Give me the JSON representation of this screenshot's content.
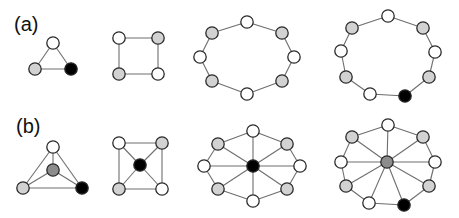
{
  "labels": {
    "a": "(a)",
    "b": "(b)"
  },
  "colors": {
    "white": "#ffffff",
    "gray": "#d2d2d2",
    "dark_gray": "#8c8c8c",
    "black": "#000000",
    "edge": "#6e6e6e",
    "outline": "#2a2a2a"
  },
  "node_radius": 6.2,
  "graphs": [
    {
      "id": "a-triangle",
      "row": "a",
      "nodes": [
        {
          "x": 53,
          "y": 43,
          "c": "white"
        },
        {
          "x": 35,
          "y": 69,
          "c": "gray"
        },
        {
          "x": 71,
          "y": 69,
          "c": "black"
        }
      ],
      "edges": [
        [
          0,
          1
        ],
        [
          1,
          2
        ],
        [
          2,
          0
        ]
      ]
    },
    {
      "id": "a-square",
      "row": "a",
      "nodes": [
        {
          "x": 119,
          "y": 38,
          "c": "white"
        },
        {
          "x": 158,
          "y": 38,
          "c": "gray"
        },
        {
          "x": 158,
          "y": 74,
          "c": "white"
        },
        {
          "x": 119,
          "y": 74,
          "c": "gray"
        }
      ],
      "edges": [
        [
          0,
          1
        ],
        [
          1,
          2
        ],
        [
          2,
          3
        ],
        [
          3,
          0
        ]
      ]
    },
    {
      "id": "a-octagon",
      "row": "a",
      "nodes": [
        {
          "x": 247,
          "y": 22,
          "c": "white"
        },
        {
          "x": 282,
          "y": 33,
          "c": "gray"
        },
        {
          "x": 294,
          "y": 57,
          "c": "white"
        },
        {
          "x": 282,
          "y": 81,
          "c": "gray"
        },
        {
          "x": 247,
          "y": 94,
          "c": "white"
        },
        {
          "x": 212,
          "y": 81,
          "c": "gray"
        },
        {
          "x": 200,
          "y": 57,
          "c": "white"
        },
        {
          "x": 212,
          "y": 33,
          "c": "gray"
        }
      ],
      "edges": [
        [
          0,
          1
        ],
        [
          1,
          2
        ],
        [
          2,
          3
        ],
        [
          3,
          4
        ],
        [
          4,
          5
        ],
        [
          5,
          6
        ],
        [
          6,
          7
        ],
        [
          7,
          0
        ]
      ]
    },
    {
      "id": "a-nonagon",
      "row": "a",
      "nodes": [
        {
          "x": 388,
          "y": 16,
          "c": "white"
        },
        {
          "x": 423,
          "y": 28,
          "c": "gray"
        },
        {
          "x": 435,
          "y": 52,
          "c": "white"
        },
        {
          "x": 429,
          "y": 77,
          "c": "gray"
        },
        {
          "x": 405,
          "y": 96,
          "c": "black"
        },
        {
          "x": 370,
          "y": 94,
          "c": "white"
        },
        {
          "x": 346,
          "y": 77,
          "c": "gray"
        },
        {
          "x": 341,
          "y": 51,
          "c": "white"
        },
        {
          "x": 352,
          "y": 28,
          "c": "gray"
        }
      ],
      "edges": [
        [
          0,
          1
        ],
        [
          1,
          2
        ],
        [
          2,
          3
        ],
        [
          3,
          4
        ],
        [
          4,
          5
        ],
        [
          5,
          6
        ],
        [
          6,
          7
        ],
        [
          7,
          8
        ],
        [
          8,
          0
        ]
      ]
    },
    {
      "id": "b-triangle-wheel",
      "row": "b",
      "nodes": [
        {
          "x": 53,
          "y": 147,
          "c": "white"
        },
        {
          "x": 82,
          "y": 188,
          "c": "black"
        },
        {
          "x": 23,
          "y": 188,
          "c": "gray"
        },
        {
          "x": 53,
          "y": 170,
          "c": "dark_gray"
        }
      ],
      "edges": [
        [
          0,
          1
        ],
        [
          1,
          2
        ],
        [
          2,
          0
        ],
        [
          3,
          0
        ],
        [
          3,
          1
        ],
        [
          3,
          2
        ]
      ]
    },
    {
      "id": "b-square-wheel",
      "row": "b",
      "nodes": [
        {
          "x": 119,
          "y": 143,
          "c": "white"
        },
        {
          "x": 162,
          "y": 143,
          "c": "gray"
        },
        {
          "x": 162,
          "y": 189,
          "c": "white"
        },
        {
          "x": 119,
          "y": 189,
          "c": "gray"
        },
        {
          "x": 140,
          "y": 165,
          "c": "black"
        }
      ],
      "edges": [
        [
          0,
          1
        ],
        [
          1,
          2
        ],
        [
          2,
          3
        ],
        [
          3,
          0
        ],
        [
          4,
          0
        ],
        [
          4,
          1
        ],
        [
          4,
          2
        ],
        [
          4,
          3
        ]
      ]
    },
    {
      "id": "b-octagon-wheel",
      "row": "b",
      "nodes": [
        {
          "x": 253,
          "y": 131,
          "c": "white"
        },
        {
          "x": 287,
          "y": 144,
          "c": "gray"
        },
        {
          "x": 300,
          "y": 166,
          "c": "white"
        },
        {
          "x": 287,
          "y": 189,
          "c": "gray"
        },
        {
          "x": 253,
          "y": 201,
          "c": "white"
        },
        {
          "x": 218,
          "y": 189,
          "c": "gray"
        },
        {
          "x": 204,
          "y": 166,
          "c": "white"
        },
        {
          "x": 218,
          "y": 144,
          "c": "gray"
        },
        {
          "x": 253,
          "y": 166,
          "c": "black"
        }
      ],
      "edges": [
        [
          0,
          1
        ],
        [
          1,
          2
        ],
        [
          2,
          3
        ],
        [
          3,
          4
        ],
        [
          4,
          5
        ],
        [
          5,
          6
        ],
        [
          6,
          7
        ],
        [
          7,
          0
        ],
        [
          8,
          0
        ],
        [
          8,
          1
        ],
        [
          8,
          2
        ],
        [
          8,
          3
        ],
        [
          8,
          4
        ],
        [
          8,
          5
        ],
        [
          8,
          6
        ],
        [
          8,
          7
        ]
      ]
    },
    {
      "id": "b-nonagon-wheel",
      "row": "b",
      "nodes": [
        {
          "x": 388,
          "y": 125,
          "c": "white"
        },
        {
          "x": 423,
          "y": 137,
          "c": "gray"
        },
        {
          "x": 435,
          "y": 162,
          "c": "white"
        },
        {
          "x": 429,
          "y": 186,
          "c": "gray"
        },
        {
          "x": 404,
          "y": 205,
          "c": "black"
        },
        {
          "x": 369,
          "y": 203,
          "c": "white"
        },
        {
          "x": 346,
          "y": 186,
          "c": "gray"
        },
        {
          "x": 341,
          "y": 162,
          "c": "white"
        },
        {
          "x": 352,
          "y": 137,
          "c": "gray"
        },
        {
          "x": 387,
          "y": 162,
          "c": "dark_gray"
        }
      ],
      "edges": [
        [
          0,
          1
        ],
        [
          1,
          2
        ],
        [
          2,
          3
        ],
        [
          3,
          4
        ],
        [
          4,
          5
        ],
        [
          5,
          6
        ],
        [
          6,
          7
        ],
        [
          7,
          8
        ],
        [
          8,
          0
        ],
        [
          9,
          0
        ],
        [
          9,
          1
        ],
        [
          9,
          2
        ],
        [
          9,
          3
        ],
        [
          9,
          4
        ],
        [
          9,
          5
        ],
        [
          9,
          6
        ],
        [
          9,
          7
        ],
        [
          9,
          8
        ]
      ]
    }
  ]
}
